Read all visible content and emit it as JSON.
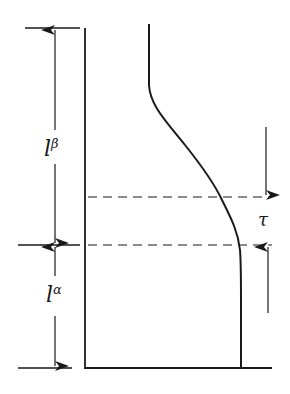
{
  "diagram": {
    "colors": {
      "line": "#1a1a1a",
      "background": "#ffffff"
    },
    "labels": {
      "l_beta": {
        "main": "l",
        "sup": "β"
      },
      "l_alpha": {
        "main": "l",
        "sup": "α"
      },
      "tau": "τ"
    },
    "dimensions": [
      {
        "name": "l-beta",
        "from_y": 28,
        "to_y": 245
      },
      {
        "name": "l-alpha",
        "from_y": 245,
        "to_y": 368
      },
      {
        "name": "tau",
        "from_y": 197,
        "to_y": 245
      }
    ]
  }
}
